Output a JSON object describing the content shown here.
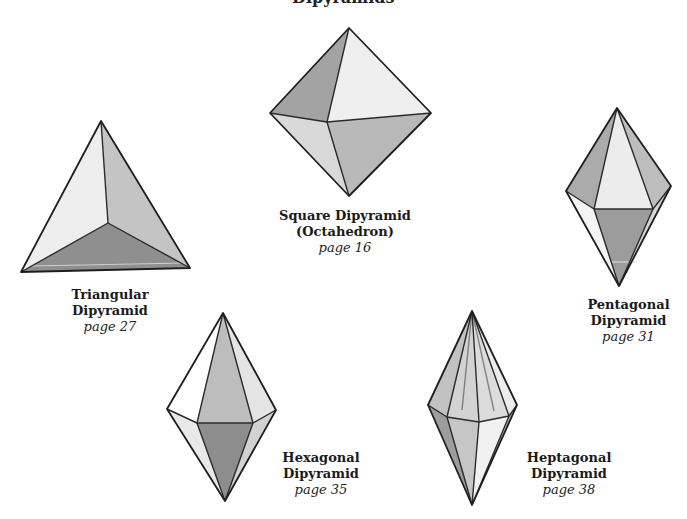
{
  "page": {
    "title_fragment": "Dipyramids"
  },
  "colors": {
    "face_white": "#ffffff",
    "face_light": "#ececec",
    "face_mid": "#c9c9c9",
    "face_dark": "#a8a8a8",
    "face_darker": "#8f8f8f",
    "edge": "#2b2b2b"
  },
  "shapes": [
    {
      "id": "triangular",
      "name_line1": "Triangular",
      "name_line2": "Dipyramid",
      "page": "page 27"
    },
    {
      "id": "square",
      "name_line1": "Square Dipyramid",
      "name_line2": "(Octahedron)",
      "page": "page 16"
    },
    {
      "id": "pentagonal",
      "name_line1": "Pentagonal",
      "name_line2": "Dipyramid",
      "page": "page 31"
    },
    {
      "id": "hexagonal",
      "name_line1": "Hexagonal",
      "name_line2": "Dipyramid",
      "page": "page 35"
    },
    {
      "id": "heptagonal",
      "name_line1": "Heptagonal",
      "name_line2": "Dipyramid",
      "page": "page 38"
    }
  ]
}
